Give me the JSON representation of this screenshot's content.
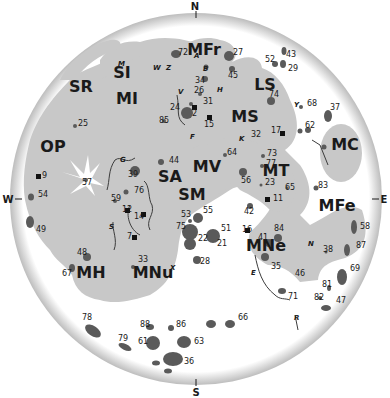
{
  "compass": {
    "north": "N",
    "south": "S",
    "east": "E",
    "west": "W"
  },
  "colors": {
    "background": "#ffffff",
    "highlands": "#ffffff",
    "maria": "#c8c8c8",
    "craters": "#5a5a5a",
    "landing_sites": "#111111",
    "rim_shadow": "#bdbdbd"
  },
  "maria": [
    {
      "abbr": "MFr",
      "x": 204,
      "y": 55
    },
    {
      "abbr": "SI",
      "x": 122,
      "y": 78
    },
    {
      "abbr": "SR",
      "x": 81,
      "y": 92
    },
    {
      "abbr": "MI",
      "x": 127,
      "y": 104
    },
    {
      "abbr": "LS",
      "x": 265,
      "y": 90
    },
    {
      "abbr": "MS",
      "x": 245,
      "y": 122
    },
    {
      "abbr": "MC",
      "x": 345,
      "y": 150
    },
    {
      "abbr": "OP",
      "x": 53,
      "y": 152
    },
    {
      "abbr": "MV",
      "x": 207,
      "y": 172
    },
    {
      "abbr": "MT",
      "x": 276,
      "y": 176
    },
    {
      "abbr": "SA",
      "x": 170,
      "y": 182
    },
    {
      "abbr": "SM",
      "x": 192,
      "y": 200
    },
    {
      "abbr": "MFe",
      "x": 337,
      "y": 211
    },
    {
      "abbr": "MNe",
      "x": 266,
      "y": 251
    },
    {
      "abbr": "MH",
      "x": 91,
      "y": 278
    },
    {
      "abbr": "MNu",
      "x": 153,
      "y": 278
    }
  ],
  "numbers": [
    {
      "n": "72",
      "x": 178,
      "y": 55
    },
    {
      "n": "27",
      "x": 233,
      "y": 55
    },
    {
      "n": "43",
      "x": 286,
      "y": 57
    },
    {
      "n": "52",
      "x": 265,
      "y": 62
    },
    {
      "n": "45",
      "x": 228,
      "y": 78
    },
    {
      "n": "29",
      "x": 288,
      "y": 71
    },
    {
      "n": "34",
      "x": 195,
      "y": 83
    },
    {
      "n": "26",
      "x": 194,
      "y": 93
    },
    {
      "n": "74",
      "x": 269,
      "y": 97
    },
    {
      "n": "68",
      "x": 307,
      "y": 106
    },
    {
      "n": "37",
      "x": 330,
      "y": 110
    },
    {
      "n": "31",
      "x": 203,
      "y": 104
    },
    {
      "n": "24",
      "x": 170,
      "y": 110
    },
    {
      "n": "2",
      "x": 192,
      "y": 116
    },
    {
      "n": "85",
      "x": 159,
      "y": 123
    },
    {
      "n": "25",
      "x": 78,
      "y": 126
    },
    {
      "n": "15",
      "x": 204,
      "y": 127
    },
    {
      "n": "62",
      "x": 305,
      "y": 128
    },
    {
      "n": "32",
      "x": 251,
      "y": 137
    },
    {
      "n": "17",
      "x": 271,
      "y": 133
    },
    {
      "n": "64",
      "x": 227,
      "y": 155
    },
    {
      "n": "73",
      "x": 267,
      "y": 156
    },
    {
      "n": "44",
      "x": 169,
      "y": 163
    },
    {
      "n": "77",
      "x": 266,
      "y": 166
    },
    {
      "n": "39",
      "x": 128,
      "y": 177
    },
    {
      "n": "9",
      "x": 42,
      "y": 178
    },
    {
      "n": "57",
      "x": 82,
      "y": 185
    },
    {
      "n": "83",
      "x": 318,
      "y": 188
    },
    {
      "n": "56",
      "x": 241,
      "y": 183
    },
    {
      "n": "23",
      "x": 265,
      "y": 185
    },
    {
      "n": "65",
      "x": 285,
      "y": 190
    },
    {
      "n": "76",
      "x": 134,
      "y": 193
    },
    {
      "n": "54",
      "x": 38,
      "y": 197
    },
    {
      "n": "59",
      "x": 111,
      "y": 201
    },
    {
      "n": "11",
      "x": 273,
      "y": 201
    },
    {
      "n": "12",
      "x": 122,
      "y": 212
    },
    {
      "n": "14",
      "x": 134,
      "y": 219
    },
    {
      "n": "53",
      "x": 181,
      "y": 217
    },
    {
      "n": "55",
      "x": 203,
      "y": 213
    },
    {
      "n": "42",
      "x": 244,
      "y": 214
    },
    {
      "n": "75",
      "x": 176,
      "y": 229
    },
    {
      "n": "51",
      "x": 221,
      "y": 231
    },
    {
      "n": "16",
      "x": 242,
      "y": 232
    },
    {
      "n": "84",
      "x": 274,
      "y": 231
    },
    {
      "n": "58",
      "x": 360,
      "y": 229
    },
    {
      "n": "49",
      "x": 36,
      "y": 232
    },
    {
      "n": "7",
      "x": 127,
      "y": 239
    },
    {
      "n": "22",
      "x": 198,
      "y": 241
    },
    {
      "n": "21",
      "x": 217,
      "y": 246
    },
    {
      "n": "41",
      "x": 258,
      "y": 240
    },
    {
      "n": "87",
      "x": 356,
      "y": 248
    },
    {
      "n": "38",
      "x": 323,
      "y": 252
    },
    {
      "n": "48",
      "x": 77,
      "y": 255
    },
    {
      "n": "35",
      "x": 271,
      "y": 269
    },
    {
      "n": "28",
      "x": 200,
      "y": 264
    },
    {
      "n": "33",
      "x": 138,
      "y": 262
    },
    {
      "n": "69",
      "x": 350,
      "y": 271
    },
    {
      "n": "46",
      "x": 295,
      "y": 276
    },
    {
      "n": "67",
      "x": 62,
      "y": 276
    },
    {
      "n": "81",
      "x": 322,
      "y": 287
    },
    {
      "n": "71",
      "x": 288,
      "y": 299
    },
    {
      "n": "82",
      "x": 314,
      "y": 300
    },
    {
      "n": "47",
      "x": 336,
      "y": 303
    },
    {
      "n": "78",
      "x": 82,
      "y": 320
    },
    {
      "n": "66",
      "x": 238,
      "y": 320
    },
    {
      "n": "88",
      "x": 140,
      "y": 327
    },
    {
      "n": "86",
      "x": 176,
      "y": 327
    },
    {
      "n": "79",
      "x": 118,
      "y": 341
    },
    {
      "n": "61",
      "x": 138,
      "y": 344
    },
    {
      "n": "63",
      "x": 194,
      "y": 344
    },
    {
      "n": "36",
      "x": 184,
      "y": 364
    }
  ],
  "letters": [
    {
      "l": "M",
      "x": 118,
      "y": 66
    },
    {
      "l": "W",
      "x": 153,
      "y": 70
    },
    {
      "l": "Z",
      "x": 166,
      "y": 70
    },
    {
      "l": "A",
      "x": 194,
      "y": 58
    },
    {
      "l": "B",
      "x": 203,
      "y": 71
    },
    {
      "l": "H",
      "x": 217,
      "y": 92
    },
    {
      "l": "V",
      "x": 178,
      "y": 94
    },
    {
      "l": "F",
      "x": 190,
      "y": 139
    },
    {
      "l": "K",
      "x": 239,
      "y": 141
    },
    {
      "l": "Y",
      "x": 294,
      "y": 107
    },
    {
      "l": "G",
      "x": 120,
      "y": 162
    },
    {
      "l": "S",
      "x": 109,
      "y": 229
    },
    {
      "l": "X",
      "x": 170,
      "y": 270
    },
    {
      "l": "N",
      "x": 308,
      "y": 246
    },
    {
      "l": "E",
      "x": 251,
      "y": 275
    },
    {
      "l": "R",
      "x": 294,
      "y": 320
    }
  ]
}
